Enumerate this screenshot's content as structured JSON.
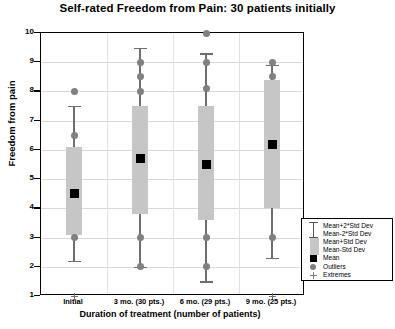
{
  "chart_data": {
    "type": "box",
    "title": "Self-rated Freedom from Pain:  30 patients initially",
    "xlabel": "Duration of treatment (number of patients)",
    "ylabel": "Freedom from pain",
    "ylim": [
      1,
      10
    ],
    "yticks": [
      10,
      9,
      8,
      7,
      6,
      5,
      4,
      3,
      2,
      1
    ],
    "grid": true,
    "categories": [
      "Initial",
      "3 mo. (30 pts.)",
      "6 mo. (29 pts.)",
      "9 mo. (25 pts.)"
    ],
    "boxes": [
      {
        "category": "Initial",
        "mean": 4.5,
        "box_low": 3.1,
        "box_high": 6.1,
        "whisker_low": 2.2,
        "whisker_high": 7.5,
        "outliers": [
          8.0,
          6.5,
          3.0
        ],
        "extremes": [
          1.0
        ]
      },
      {
        "category": "3 mo. (30 pts.)",
        "mean": 5.7,
        "box_low": 3.8,
        "box_high": 7.5,
        "whisker_low": 2.0,
        "whisker_high": 9.5,
        "outliers": [
          9.0,
          8.5,
          8.0,
          3.0,
          2.0
        ],
        "extremes": []
      },
      {
        "category": "6 mo. (29 pts.)",
        "mean": 5.5,
        "box_low": 3.6,
        "box_high": 7.5,
        "whisker_low": 1.5,
        "whisker_high": 9.3,
        "outliers": [
          10.0,
          9.0,
          8.1,
          3.0,
          2.0
        ],
        "extremes": []
      },
      {
        "category": "9 mo. (25 pts.)",
        "mean": 6.2,
        "box_low": 4.0,
        "box_high": 8.4,
        "whisker_low": 2.3,
        "whisker_high": 8.9,
        "outliers": [
          9.0,
          8.5,
          3.0
        ],
        "extremes": [
          1.0
        ]
      }
    ],
    "legend": {
      "position": "bottom-right",
      "entries": [
        {
          "key": "ibar",
          "label": "Mean+2*Std Dev"
        },
        {
          "key": "ibar2",
          "label": "Mean-2*Std Dev"
        },
        {
          "key": "graybox",
          "label": "Mean+Std Dev"
        },
        {
          "key": "graybox2",
          "label": "Mean-Std Dev"
        },
        {
          "key": "blackbox",
          "label": "Mean"
        },
        {
          "key": "circle",
          "label": "Outliers"
        },
        {
          "key": "cross",
          "label": "Extremes"
        }
      ]
    },
    "colors": {
      "box_fill": "#c6c6c6",
      "mean_marker": "#000000",
      "whisker": "#6e6e6e",
      "outlier": "#808080",
      "grid": "#d9d9d9",
      "axis": "#000000"
    }
  }
}
